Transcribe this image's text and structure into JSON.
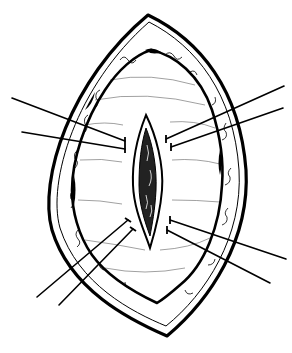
{
  "figure": {
    "title": "",
    "colors": {
      "background": "#ffffff",
      "ink": "#000000",
      "tissue": "#ffffff"
    },
    "outer_skin_edge": {
      "top_tip": [
        148,
        15
      ],
      "bottom_tip": [
        167,
        336
      ],
      "left_extreme": [
        46,
        190
      ],
      "right_extreme": [
        246,
        170
      ]
    },
    "inner_wound_edge": {
      "top": [
        151,
        50
      ],
      "bottom": [
        157,
        303
      ],
      "left": [
        72,
        190
      ],
      "right": [
        222,
        170
      ]
    },
    "central_incision": {
      "top": [
        146,
        115
      ],
      "bottom": [
        150,
        248
      ],
      "left": [
        133,
        180
      ],
      "right": [
        162,
        180
      ]
    },
    "retraction_sutures": [
      {
        "id": "upper-left-1",
        "from": [
          125,
          141
        ],
        "to": [
          12,
          98
        ]
      },
      {
        "id": "upper-left-2",
        "from": [
          125,
          149
        ],
        "to": [
          22,
          132
        ]
      },
      {
        "id": "upper-right-1",
        "from": [
          166,
          139
        ],
        "to": [
          284,
          86
        ]
      },
      {
        "id": "upper-right-2",
        "from": [
          171,
          147
        ],
        "to": [
          283,
          108
        ]
      },
      {
        "id": "lower-left-1",
        "from": [
          128,
          220
        ],
        "to": [
          37,
          297
        ]
      },
      {
        "id": "lower-left-2",
        "from": [
          133,
          229
        ],
        "to": [
          59,
          305
        ]
      },
      {
        "id": "lower-right-1",
        "from": [
          170,
          220
        ],
        "to": [
          286,
          259
        ]
      },
      {
        "id": "lower-right-2",
        "from": [
          167,
          230
        ],
        "to": [
          270,
          283
        ]
      }
    ]
  }
}
